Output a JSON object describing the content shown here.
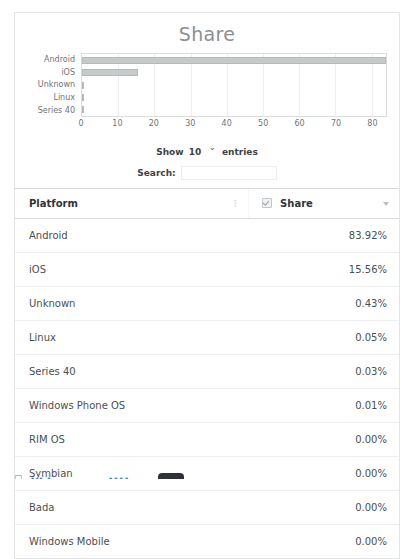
{
  "chart_data": {
    "type": "bar",
    "orientation": "horizontal",
    "title": "Share",
    "xlabel": "",
    "ylabel": "",
    "categories": [
      "Android",
      "iOS",
      "Unknown",
      "Linux",
      "Series 40"
    ],
    "values": [
      83.92,
      15.56,
      0.43,
      0.05,
      0.03
    ],
    "xticks": [
      "0",
      "10",
      "20",
      "30",
      "40",
      "50",
      "60",
      "70",
      "80"
    ],
    "xtick_values": [
      0,
      10,
      20,
      30,
      40,
      50,
      60,
      70,
      80
    ],
    "xlim": [
      0,
      84
    ],
    "grid": "vertical",
    "legend": "none",
    "bar_color": "#c6cacb",
    "bar_border_color": "#b4b9ba"
  },
  "controls": {
    "length_prefix": "Show",
    "length_value": "10",
    "length_suffix": "entries",
    "length_chevron": "chevron-down-icon",
    "search_label": "Search:",
    "search_value": "",
    "search_placeholder": ""
  },
  "table": {
    "columns": [
      {
        "label": "Platform",
        "sort": "sortable"
      },
      {
        "label": "Share",
        "sort": "descending"
      }
    ],
    "rows": [
      {
        "platform": "Android",
        "share": "83.92%"
      },
      {
        "platform": "iOS",
        "share": "15.56%"
      },
      {
        "platform": "Unknown",
        "share": "0.43%"
      },
      {
        "platform": "Linux",
        "share": "0.05%"
      },
      {
        "platform": "Series 40",
        "share": "0.03%"
      },
      {
        "platform": "Windows Phone OS",
        "share": "0.01%"
      },
      {
        "platform": "RIM OS",
        "share": "0.00%"
      },
      {
        "platform": "Symbian",
        "share": "0.00%"
      },
      {
        "platform": "Bada",
        "share": "0.00%"
      },
      {
        "platform": "Windows Mobile",
        "share": "0.00%"
      }
    ]
  },
  "colors": {
    "card_border": "#e2e4e6",
    "title_text": "#8a8f93",
    "body_text": "#4a4f53",
    "header_text": "#2f3438",
    "row_divider": "#eceef0",
    "link": "#4a7fc1"
  }
}
